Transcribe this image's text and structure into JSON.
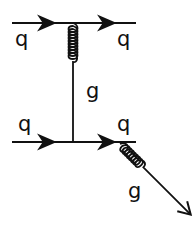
{
  "diagram": {
    "type": "feynman",
    "title": "",
    "colors": {
      "ink": "#111111",
      "background": "#ffffff"
    },
    "labels": {
      "top_left_quark": "q",
      "top_right_quark": "q",
      "exchanged_gluon": "g",
      "bottom_left_quark": "q",
      "bottom_right_quark": "q",
      "emitted_gluon": "g"
    },
    "lines": [
      {
        "id": "top-quark-line",
        "kind": "fermion",
        "from": "incoming-q",
        "to": "outgoing-q",
        "arrows": 2
      },
      {
        "id": "t-channel-gluon",
        "kind": "gluon",
        "from": "top-vertex",
        "to": "bottom-vertex"
      },
      {
        "id": "bottom-quark-line",
        "kind": "fermion",
        "from": "incoming-q",
        "to": "outgoing-q",
        "arrows": 2
      },
      {
        "id": "radiated-gluon",
        "kind": "gluon",
        "from": "bottom-right-vertex",
        "to": "outgoing-g",
        "arrowhead": true
      }
    ]
  }
}
